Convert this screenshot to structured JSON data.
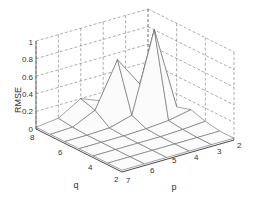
{
  "chart_data": {
    "type": "surface3d",
    "title": "",
    "xlabel": "p",
    "ylabel": "q",
    "zlabel": "RMSE",
    "x_ticks": [
      "2",
      "3",
      "4",
      "5",
      "6",
      "7"
    ],
    "y_ticks": [
      "2",
      "4",
      "6",
      "8"
    ],
    "z_ticks": [
      "0",
      "0.2",
      "0.4",
      "0.6",
      "0.8",
      "1"
    ],
    "zlim": [
      0,
      1
    ],
    "grid": true,
    "p": [
      2,
      3,
      4,
      5,
      6,
      7
    ],
    "q": [
      2,
      3,
      4,
      5,
      6,
      7,
      8
    ],
    "z_rmse_rows_by_q": [
      {
        "q": 2,
        "values": [
          0.02,
          0.02,
          0.02,
          0.02,
          0.02,
          0.02
        ]
      },
      {
        "q": 3,
        "values": [
          0.02,
          0.02,
          0.02,
          0.02,
          0.02,
          0.02
        ]
      },
      {
        "q": 4,
        "values": [
          0.05,
          0.03,
          0.02,
          0.02,
          0.02,
          0.02
        ]
      },
      {
        "q": 5,
        "values": [
          0.1,
          0.05,
          0.03,
          0.02,
          0.02,
          0.02
        ]
      },
      {
        "q": 6,
        "values": [
          0.05,
          1.0,
          0.1,
          0.03,
          0.02,
          0.02
        ]
      },
      {
        "q": 7,
        "values": [
          0.05,
          0.3,
          0.65,
          0.15,
          0.03,
          0.02
        ]
      },
      {
        "q": 8,
        "values": [
          0.05,
          0.1,
          0.1,
          0.2,
          0.05,
          0.02
        ]
      }
    ]
  },
  "labels": {
    "zlabel": "RMSE",
    "xlabel": "p",
    "ylabel": "q",
    "z_ticks": [
      {
        "label": "1",
        "y": 43
      },
      {
        "label": "0.8",
        "y": 60
      },
      {
        "label": "0.6",
        "y": 78
      },
      {
        "label": "0.4",
        "y": 95
      },
      {
        "label": "0.2",
        "y": 112
      },
      {
        "label": "0",
        "y": 130
      }
    ],
    "q_ticks": [
      {
        "label": "8",
        "x": 30,
        "y": 140
      },
      {
        "label": "6",
        "x": 58,
        "y": 155
      },
      {
        "label": "4",
        "x": 88,
        "y": 170
      },
      {
        "label": "2",
        "x": 114,
        "y": 182
      }
    ],
    "p_ticks": [
      {
        "label": "7",
        "x": 126,
        "y": 183
      },
      {
        "label": "6",
        "x": 150,
        "y": 173
      },
      {
        "label": "5",
        "x": 172,
        "y": 163
      },
      {
        "label": "4",
        "x": 194,
        "y": 160
      },
      {
        "label": "3",
        "x": 217,
        "y": 154
      },
      {
        "label": "2",
        "x": 237,
        "y": 148
      }
    ]
  }
}
